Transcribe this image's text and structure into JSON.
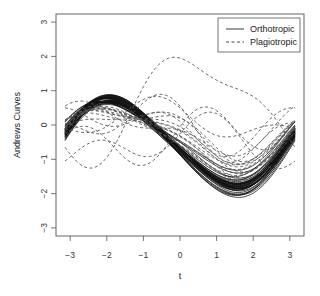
{
  "chart_data": {
    "type": "line",
    "title": "",
    "xlabel": "t",
    "ylabel": "Andrews Curves",
    "xlim": [
      -3.3,
      3.3
    ],
    "ylim": [
      -3.2,
      3.3
    ],
    "xticks": [
      -3,
      -2,
      -1,
      0,
      1,
      2,
      3
    ],
    "yticks": [
      -3,
      -2,
      -1,
      0,
      1,
      2,
      3
    ],
    "grid": false,
    "legend": {
      "position": "top-right",
      "entries": [
        {
          "label": "Orthotropic",
          "style": "solid"
        },
        {
          "label": "Plagiotropic",
          "style": "dashed"
        }
      ]
    },
    "function_form": "f(t) = c0 + c1*sin(t) + c2*cos(t) + c3*sin(2t) + c4*cos(2t)",
    "t_range": [
      -3.14159,
      3.14159
    ],
    "series": [
      {
        "name": "Orthotropic",
        "style": "solid",
        "color": "#111111",
        "description": "about 60 tightly clustered curves; max ~0.8 near t=-2.3, min ~-1.9 near t=0.8",
        "coefficients": [
          [
            -0.55,
            -1.2,
            -0.25,
            0.12,
            0.05
          ],
          [
            -0.52,
            -1.18,
            -0.22,
            0.1,
            0.04
          ],
          [
            -0.5,
            -1.22,
            -0.28,
            0.13,
            0.06
          ],
          [
            -0.58,
            -1.25,
            -0.2,
            0.11,
            0.03
          ],
          [
            -0.47,
            -1.15,
            -0.3,
            0.14,
            0.07
          ],
          [
            -0.53,
            -1.28,
            -0.24,
            0.12,
            0.05
          ],
          [
            -0.56,
            -1.1,
            -0.26,
            0.1,
            0.04
          ],
          [
            -0.49,
            -1.3,
            -0.22,
            0.15,
            0.06
          ],
          [
            -0.6,
            -1.22,
            -0.18,
            0.12,
            0.02
          ],
          [
            -0.45,
            -1.2,
            -0.32,
            0.11,
            0.08
          ],
          [
            -0.51,
            -1.33,
            -0.27,
            0.13,
            0.05
          ],
          [
            -0.54,
            -1.12,
            -0.21,
            0.12,
            0.04
          ],
          [
            -0.57,
            -1.27,
            -0.29,
            0.14,
            0.06
          ],
          [
            -0.5,
            -1.17,
            -0.23,
            0.1,
            0.05
          ],
          [
            -0.48,
            -1.24,
            -0.26,
            0.13,
            0.07
          ],
          [
            -0.59,
            -1.19,
            -0.24,
            0.11,
            0.03
          ],
          [
            -0.52,
            -1.35,
            -0.2,
            0.14,
            0.05
          ],
          [
            -0.46,
            -1.08,
            -0.28,
            0.12,
            0.06
          ],
          [
            -0.55,
            -1.31,
            -0.31,
            0.13,
            0.04
          ],
          [
            -0.53,
            -1.14,
            -0.19,
            0.1,
            0.05
          ],
          [
            -0.49,
            -1.26,
            -0.25,
            0.12,
            0.06
          ],
          [
            -0.61,
            -1.21,
            -0.27,
            0.13,
            0.03
          ],
          [
            -0.44,
            -1.23,
            -0.23,
            0.11,
            0.07
          ],
          [
            -0.56,
            -1.16,
            -0.3,
            0.14,
            0.05
          ],
          [
            -0.51,
            -1.29,
            -0.21,
            0.12,
            0.04
          ],
          [
            -0.48,
            -1.11,
            -0.26,
            0.11,
            0.06
          ],
          [
            -0.58,
            -1.34,
            -0.24,
            0.13,
            0.05
          ],
          [
            -0.5,
            -1.2,
            -0.33,
            0.12,
            0.07
          ],
          [
            -0.54,
            -1.25,
            -0.17,
            0.1,
            0.04
          ],
          [
            -0.47,
            -1.18,
            -0.28,
            0.14,
            0.06
          ],
          [
            -0.4,
            -1.05,
            -0.2,
            0.12,
            0.1
          ],
          [
            -0.38,
            -1.0,
            -0.35,
            0.1,
            0.12
          ],
          [
            -0.35,
            -0.95,
            -0.25,
            0.14,
            0.1
          ],
          [
            -0.42,
            -1.1,
            -0.3,
            0.11,
            0.09
          ],
          [
            -0.3,
            -0.9,
            -0.28,
            0.13,
            0.12
          ],
          [
            -0.62,
            -1.4,
            -0.26,
            0.12,
            0.02
          ],
          [
            -0.65,
            -1.38,
            -0.22,
            0.14,
            0.01
          ],
          [
            -0.6,
            -1.42,
            -0.3,
            0.11,
            0.03
          ],
          [
            -0.63,
            -1.36,
            -0.24,
            0.13,
            0.02
          ],
          [
            -0.66,
            -1.45,
            -0.2,
            0.12,
            0.0
          ]
        ]
      },
      {
        "name": "Plagiotropic",
        "style": "dashed",
        "color": "#555555",
        "description": "about 20 widely varying curves",
        "coefficients": [
          [
            0.55,
            0.6,
            1.3,
            -0.45,
            0.1
          ],
          [
            -0.1,
            -0.55,
            0.25,
            -0.35,
            0.4
          ],
          [
            -0.35,
            0.35,
            0.1,
            0.55,
            0.2
          ],
          [
            -0.2,
            -0.7,
            -0.1,
            0.05,
            0.25
          ],
          [
            -0.3,
            -0.85,
            -0.05,
            0.15,
            0.2
          ],
          [
            -0.15,
            -0.6,
            0.05,
            0.1,
            0.3
          ],
          [
            -0.25,
            -0.75,
            -0.15,
            0.08,
            0.22
          ],
          [
            -0.4,
            -0.95,
            -0.1,
            0.14,
            0.18
          ],
          [
            -0.05,
            -0.4,
            -0.2,
            -0.25,
            0.35
          ],
          [
            -0.45,
            -0.9,
            -0.25,
            0.1,
            0.12
          ],
          [
            -0.35,
            -0.8,
            -0.3,
            0.12,
            0.15
          ],
          [
            -0.2,
            -0.65,
            0.15,
            0.02,
            0.28
          ],
          [
            0.1,
            -0.3,
            0.3,
            -0.3,
            0.1
          ],
          [
            -0.5,
            -1.0,
            -0.2,
            0.15,
            0.1
          ],
          [
            -0.28,
            -0.7,
            -0.22,
            0.06,
            0.18
          ],
          [
            -0.55,
            0.2,
            0.4,
            0.5,
            -0.1
          ],
          [
            -0.1,
            -0.5,
            -0.35,
            0.1,
            0.3
          ],
          [
            -0.38,
            -0.88,
            -0.12,
            0.12,
            0.16
          ]
        ]
      }
    ]
  },
  "axes": {
    "x_title": "t",
    "y_title": "Andrews Curves",
    "x_tick_labels": [
      "−3",
      "−2",
      "−1",
      "0",
      "1",
      "2",
      "3"
    ],
    "y_tick_labels": [
      "−3",
      "−2",
      "−1",
      "0",
      "1",
      "2",
      "3"
    ]
  },
  "legend": {
    "items": [
      {
        "label": "Orthotropic"
      },
      {
        "label": "Plagiotropic"
      }
    ]
  }
}
